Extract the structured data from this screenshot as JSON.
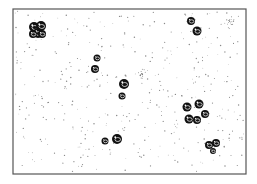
{
  "figure": {
    "width": 257,
    "height": 184,
    "frame": {
      "x": 13,
      "y": 9,
      "width": 233,
      "height": 165,
      "stroke": "#555555"
    },
    "background": "#ffffff",
    "ink": "#111111",
    "stipple_color": "#8a8a8a",
    "stipple_count": 420,
    "clusters": [
      {
        "id": "top-left",
        "cells": [
          [
            34,
            27,
            5
          ],
          [
            41,
            26,
            5
          ],
          [
            38,
            33,
            5
          ],
          [
            33,
            34,
            4
          ],
          [
            42,
            34,
            4
          ]
        ]
      },
      {
        "id": "top-right-pair",
        "cells": [
          [
            191,
            21,
            4
          ],
          [
            197,
            31,
            4.5
          ]
        ]
      },
      {
        "id": "left-mid-pair",
        "cells": [
          [
            97,
            58,
            3.5
          ],
          [
            95,
            69,
            4
          ]
        ]
      },
      {
        "id": "center",
        "cells": [
          [
            124,
            84,
            5
          ],
          [
            122,
            96,
            3.5
          ]
        ]
      },
      {
        "id": "right-cluster",
        "cells": [
          [
            187,
            107,
            4.5
          ],
          [
            199,
            104,
            4.5
          ],
          [
            205,
            114,
            4
          ],
          [
            189,
            119,
            4.5
          ],
          [
            197,
            120,
            4
          ]
        ]
      },
      {
        "id": "bottom-pair",
        "cells": [
          [
            105,
            141,
            3.5
          ],
          [
            117,
            139,
            5
          ]
        ]
      },
      {
        "id": "bottom-right",
        "cells": [
          [
            209,
            145,
            4
          ],
          [
            216,
            143,
            4
          ],
          [
            213,
            151,
            3
          ]
        ]
      }
    ],
    "faint_spots": [
      {
        "id": "faint-center",
        "x": 142,
        "y": 74,
        "r": 4
      },
      {
        "id": "faint-top-right",
        "x": 230,
        "y": 22,
        "r": 5
      }
    ]
  }
}
